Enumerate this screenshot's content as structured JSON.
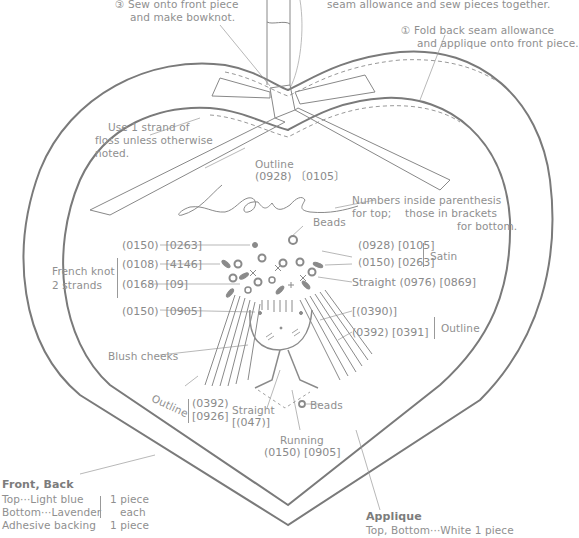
{
  "diagram": {
    "steps": {
      "step3": "③ Sew onto front piece",
      "step3b": "and make bowknot.",
      "step2": "seam allowance and sew pieces together.",
      "step1": "① Fold back seam allowance",
      "step1b": "and applique onto front piece."
    },
    "notes": {
      "strand_1": "Use 1 strand of",
      "strand_2": "floss unless otherwise",
      "strand_3": "noted.",
      "legend_1": "Numbers inside parenthesis",
      "legend_2a": "for top;",
      "legend_2b": "those in brackets",
      "legend_3": "for bottom."
    },
    "love": {
      "word": "Love",
      "stitch": "Outline",
      "codes": "(0928) 〔0105〕"
    },
    "beads_top": "Beads",
    "left_codes": [
      {
        "top": "(0150)",
        "bottom": "[0263]"
      },
      {
        "top": "(0108)",
        "bottom": "[4146]"
      },
      {
        "top": "(0168)",
        "bottom": "[09]"
      },
      {
        "top": "(0150)",
        "bottom": "[0905]"
      }
    ],
    "french_knot": {
      "line1": "French knot",
      "line2": "2 strands"
    },
    "right_codes": {
      "satin_1": "(0928)  [0105]",
      "satin_2": "(0150)  [0263]",
      "satin_label": "Satin",
      "straight": "Straight (0976)  [0869]",
      "outline_1": "[(0390)]",
      "outline_2": "(0392)  [0391]",
      "outline_label": "Outline"
    },
    "blush": "Blush cheeks",
    "bottom_left_codes": {
      "label": "Outline",
      "code1": "(0392)",
      "code2": "[0926]",
      "straight": "Straight",
      "straight_code": "[(047)]"
    },
    "beads_bottom": "Beads",
    "running": {
      "label": "Running",
      "codes": "(0150)  [0905]"
    },
    "front_back": {
      "title": "Front, Back",
      "row1": "Top···Light blue",
      "row2": "Bottom···Lavender",
      "row3": "Adhesive backing",
      "qty1": "1 piece",
      "qty2": "each",
      "qty3": "1 piece"
    },
    "applique": {
      "title": "Applique",
      "desc": "Top, Bottom···White 1 piece"
    },
    "colors": {
      "line": "#7a7a7a",
      "text": "#8f8f8f",
      "fill": "#8a8a8a"
    }
  }
}
